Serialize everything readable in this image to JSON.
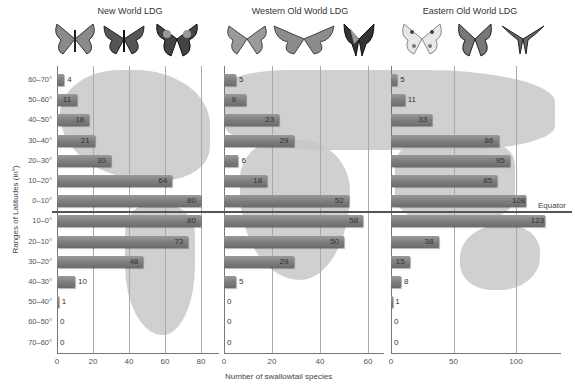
{
  "chart_data": {
    "type": "bar",
    "orientation": "horizontal",
    "ylabel": "Ranges of Latitudes (in°)",
    "xlabel": "Number of swallowtail species",
    "annotation": "Equator",
    "categories": [
      "60–70°",
      "50–60°",
      "40–50°",
      "30–40°",
      "20–30°",
      "10–20°",
      "0–10°",
      "10–0°",
      "20–10°",
      "30–20°",
      "40–30°",
      "50–40°",
      "60–50°",
      "70–60°"
    ],
    "series": [
      {
        "name": "New World LDG",
        "values": [
          4,
          11,
          18,
          21,
          30,
          64,
          80,
          80,
          73,
          48,
          10,
          1,
          0,
          0
        ],
        "xticks": [
          0,
          20,
          40,
          60,
          80
        ],
        "xlim": [
          0,
          88
        ]
      },
      {
        "name": "Western Old World LDG",
        "values": [
          5,
          9,
          23,
          29,
          6,
          18,
          52,
          58,
          50,
          29,
          5,
          0,
          0,
          0
        ],
        "xticks": [
          0,
          20,
          40,
          60
        ],
        "xlim": [
          0,
          66
        ]
      },
      {
        "name": "Eastern Old World LDG",
        "values": [
          5,
          11,
          33,
          86,
          95,
          85,
          108,
          123,
          38,
          15,
          8,
          1,
          0,
          0
        ],
        "xticks": [
          0,
          50,
          100
        ],
        "xlim": [
          0,
          130
        ]
      }
    ]
  },
  "labels": {
    "ylabel": "Ranges of Latitudes (in°)",
    "xlabel": "Number of swallowtail species",
    "equator": "Equator",
    "panel_titles": [
      "New World LDG",
      "Western Old World LDG",
      "Eastern Old World LDG"
    ]
  }
}
